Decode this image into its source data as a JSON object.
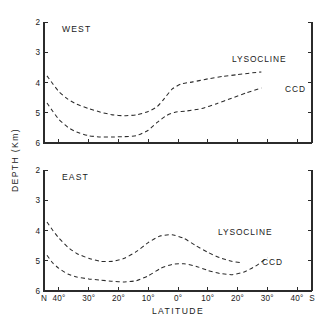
{
  "chart_data": {
    "type": "line",
    "title": "",
    "xlabel": "LATITUDE",
    "ylabel": "DEPTH (Km)",
    "ylim": [
      2,
      6
    ],
    "y_inverted": true,
    "yticks": [
      2,
      3,
      4,
      5,
      6
    ],
    "ytick_labels": [
      "2",
      "3",
      "4",
      "5",
      "6"
    ],
    "x": [
      45,
      40,
      35,
      30,
      25,
      20,
      15,
      10,
      5,
      0,
      -5,
      -10,
      -15,
      -20,
      -25,
      -30,
      -35,
      -40,
      -45
    ],
    "xticks": [
      45,
      40,
      30,
      20,
      10,
      0,
      -10,
      -20,
      -30,
      -40,
      -45
    ],
    "xtick_labels": [
      "N",
      "40°",
      "30°",
      "20°",
      "10°",
      "0°",
      "10°",
      "20°",
      "30°",
      "40°",
      "S"
    ],
    "grid": false,
    "legend_position": "inline-annotation",
    "line_style": "dashed",
    "color": "#2b2b2b",
    "panels": [
      {
        "tag": "WEST",
        "series": [
          {
            "name": "LYSOCLINE",
            "label": "LYSOCLINE",
            "x": [
              44.0,
              42.0,
              40.0,
              37.0,
              34.0,
              30.0,
              26.0,
              22.0,
              18.0,
              14.0,
              10.0,
              7.0,
              5.0,
              2.0,
              -1.0,
              -5.0,
              -10.0,
              -15.0,
              -20.0,
              -25.0,
              -28.0
            ],
            "y": [
              3.78,
              4.05,
              4.3,
              4.55,
              4.72,
              4.86,
              4.98,
              5.07,
              5.1,
              5.07,
              4.96,
              4.8,
              4.58,
              4.22,
              4.05,
              3.98,
              3.88,
              3.8,
              3.74,
              3.68,
              3.65
            ]
          },
          {
            "name": "CCD",
            "label": "CCD",
            "x": [
              44.0,
              42.0,
              40.0,
              37.0,
              34.0,
              30.0,
              26.0,
              22.0,
              18.0,
              14.0,
              10.0,
              7.0,
              4.0,
              1.0,
              -3.0,
              -8.0,
              -13.0,
              -18.0,
              -23.0,
              -28.0
            ],
            "y": [
              4.68,
              4.96,
              5.22,
              5.48,
              5.64,
              5.76,
              5.8,
              5.8,
              5.79,
              5.76,
              5.58,
              5.32,
              5.1,
              4.98,
              4.94,
              4.86,
              4.7,
              4.52,
              4.34,
              4.18
            ]
          }
        ]
      },
      {
        "tag": "EAST",
        "series": [
          {
            "name": "LYSOCLINE",
            "label": "LYSOCLINE",
            "x": [
              44.0,
              42.0,
              40.0,
              37.0,
              34.0,
              30.0,
              26.0,
              22.0,
              18.0,
              14.0,
              10.0,
              6.0,
              2.0,
              -2.0,
              -6.0,
              -10.0,
              -14.0,
              -18.0,
              -21.0
            ],
            "y": [
              3.72,
              4.0,
              4.25,
              4.55,
              4.76,
              4.92,
              5.02,
              5.02,
              4.92,
              4.7,
              4.4,
              4.18,
              4.14,
              4.26,
              4.5,
              4.72,
              4.9,
              5.02,
              5.06
            ]
          },
          {
            "name": "CCD",
            "label": "CCD",
            "x": [
              44.0,
              42.0,
              40.0,
              37.0,
              34.0,
              30.0,
              26.0,
              22.0,
              18.0,
              14.0,
              10.0,
              6.0,
              2.0,
              -2.0,
              -6.0,
              -10.0,
              -14.0,
              -18.0,
              -22.0,
              -26.0,
              -30.0
            ],
            "y": [
              4.82,
              5.08,
              5.25,
              5.44,
              5.54,
              5.6,
              5.64,
              5.68,
              5.7,
              5.66,
              5.5,
              5.26,
              5.12,
              5.1,
              5.18,
              5.32,
              5.42,
              5.46,
              5.38,
              5.18,
              4.9
            ]
          }
        ]
      }
    ]
  },
  "figure": {
    "y_axis_title": "DEPTH (Km)",
    "x_axis_title": "LATITUDE",
    "panel_west_tag": "WEST",
    "panel_east_tag": "EAST",
    "lysocline_label": "LYSOCLINE",
    "ccd_label": "CCD",
    "ytick_2": "2",
    "ytick_3": "3",
    "ytick_4": "4",
    "ytick_5": "5",
    "ytick_6": "6",
    "xtick_N": "N",
    "xtick_n40": "40°",
    "xtick_n30": "30°",
    "xtick_n20": "20°",
    "xtick_n10": "10°",
    "xtick_0": "0°",
    "xtick_s10": "10°",
    "xtick_s20": "20°",
    "xtick_s30": "30°",
    "xtick_s40": "40°",
    "xtick_S": "S"
  }
}
